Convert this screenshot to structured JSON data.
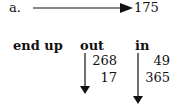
{
  "problem": {
    "label": "a.",
    "result_value": "175"
  },
  "table": {
    "headers": {
      "end_up": "end up",
      "out": "out",
      "in": "in"
    },
    "out_values": [
      "268",
      "17"
    ],
    "in_values": [
      "49",
      "365"
    ]
  }
}
